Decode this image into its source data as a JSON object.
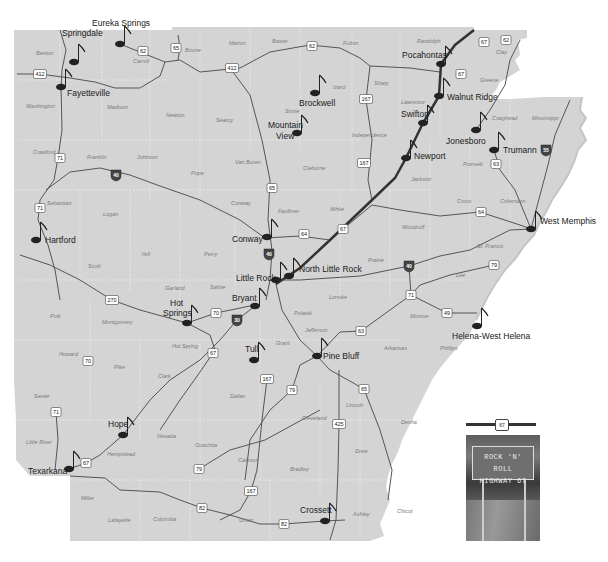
{
  "map": {
    "title": "Rock 'n' Roll Highway 67 - Arkansas",
    "colors": {
      "state_fill": "#d4d4d4",
      "background": "#ffffff",
      "county_border": "#eeeeee",
      "road": "#555555",
      "highway67": "#333333",
      "city_text": "#1a1a1a",
      "county_text": "#7a7a7a"
    },
    "cities": [
      {
        "name": "Eureka Springs",
        "x": 92,
        "y": 26,
        "dot_x": 120,
        "dot_y": 44
      },
      {
        "name": "Springdale",
        "x": 62,
        "y": 36,
        "dot_x": 74,
        "dot_y": 62
      },
      {
        "name": "Fayetteville",
        "x": 67,
        "y": 96,
        "dot_x": 61,
        "dot_y": 87
      },
      {
        "name": "Brockwell",
        "x": 299,
        "y": 106,
        "dot_x": 315,
        "dot_y": 93
      },
      {
        "name": "Mountain",
        "x": 268,
        "y": 128,
        "dot_x": 297,
        "dot_y": 133
      },
      {
        "name": "View",
        "x": 276,
        "y": 139,
        "dot_x": 0,
        "dot_y": 0
      },
      {
        "name": "Pocahontas",
        "x": 402,
        "y": 58,
        "dot_x": 441,
        "dot_y": 64
      },
      {
        "name": "Walnut Ridge",
        "x": 447,
        "y": 100,
        "dot_x": 439,
        "dot_y": 96
      },
      {
        "name": "Swifton",
        "x": 401,
        "y": 117,
        "dot_x": 423,
        "dot_y": 123
      },
      {
        "name": "Jonesboro",
        "x": 446,
        "y": 144,
        "dot_x": 476,
        "dot_y": 130
      },
      {
        "name": "Trumann",
        "x": 503,
        "y": 153,
        "dot_x": 494,
        "dot_y": 150
      },
      {
        "name": "Newport",
        "x": 414,
        "y": 159,
        "dot_x": 406,
        "dot_y": 158
      },
      {
        "name": "Hartford",
        "x": 45,
        "y": 243,
        "dot_x": 36,
        "dot_y": 240
      },
      {
        "name": "Conway",
        "x": 232,
        "y": 242,
        "dot_x": 267,
        "dot_y": 237
      },
      {
        "name": "West Memphis",
        "x": 540,
        "y": 224,
        "dot_x": 531,
        "dot_y": 229
      },
      {
        "name": "Little Rock",
        "x": 236,
        "y": 281,
        "dot_x": 276,
        "dot_y": 280
      },
      {
        "name": "North Little Rock",
        "x": 299,
        "y": 272,
        "dot_x": 289,
        "dot_y": 276
      },
      {
        "name": "Hot",
        "x": 170,
        "y": 306,
        "dot_x": 187,
        "dot_y": 323
      },
      {
        "name": "Springs",
        "x": 163,
        "y": 316,
        "dot_x": 0,
        "dot_y": 0
      },
      {
        "name": "Bryant",
        "x": 232,
        "y": 301,
        "dot_x": 255,
        "dot_y": 306
      },
      {
        "name": "Helena-West Helena",
        "x": 452,
        "y": 339,
        "dot_x": 477,
        "dot_y": 326
      },
      {
        "name": "Tull",
        "x": 245,
        "y": 352,
        "dot_x": 254,
        "dot_y": 360
      },
      {
        "name": "Pine Bluff",
        "x": 323,
        "y": 359,
        "dot_x": 317,
        "dot_y": 356
      },
      {
        "name": "Hope",
        "x": 108,
        "y": 427,
        "dot_x": 123,
        "dot_y": 435
      },
      {
        "name": "Texarkana",
        "x": 28,
        "y": 474,
        "dot_x": 69,
        "dot_y": 469
      },
      {
        "name": "Crossett",
        "x": 300,
        "y": 513,
        "dot_x": 325,
        "dot_y": 521
      }
    ],
    "counties": [
      {
        "name": "Benton",
        "x": 36,
        "y": 55
      },
      {
        "name": "Carroll",
        "x": 133,
        "y": 63
      },
      {
        "name": "Boone",
        "x": 185,
        "y": 52
      },
      {
        "name": "Marion",
        "x": 229,
        "y": 45
      },
      {
        "name": "Baxter",
        "x": 272,
        "y": 43
      },
      {
        "name": "Fulton",
        "x": 343,
        "y": 45
      },
      {
        "name": "Randolph",
        "x": 417,
        "y": 43
      },
      {
        "name": "Clay",
        "x": 496,
        "y": 54
      },
      {
        "name": "Washington",
        "x": 26,
        "y": 108
      },
      {
        "name": "Madison",
        "x": 107,
        "y": 109
      },
      {
        "name": "Newton",
        "x": 166,
        "y": 117
      },
      {
        "name": "Searcy",
        "x": 216,
        "y": 122
      },
      {
        "name": "Stone",
        "x": 285,
        "y": 113
      },
      {
        "name": "Izard",
        "x": 333,
        "y": 89
      },
      {
        "name": "Sharp",
        "x": 374,
        "y": 85
      },
      {
        "name": "Greene",
        "x": 480,
        "y": 82
      },
      {
        "name": "Lawrence",
        "x": 401,
        "y": 104
      },
      {
        "name": "Independence",
        "x": 352,
        "y": 137
      },
      {
        "name": "Craighead",
        "x": 492,
        "y": 120
      },
      {
        "name": "Mississippi",
        "x": 532,
        "y": 120
      },
      {
        "name": "Crawford",
        "x": 33,
        "y": 154
      },
      {
        "name": "Franklin",
        "x": 87,
        "y": 159
      },
      {
        "name": "Johnson",
        "x": 137,
        "y": 159
      },
      {
        "name": "Van Buren",
        "x": 235,
        "y": 164
      },
      {
        "name": "Cleburne",
        "x": 303,
        "y": 170
      },
      {
        "name": "Poinsett",
        "x": 463,
        "y": 166
      },
      {
        "name": "Jackson",
        "x": 411,
        "y": 181
      },
      {
        "name": "Pope",
        "x": 191,
        "y": 175
      },
      {
        "name": "Sebastian",
        "x": 47,
        "y": 205
      },
      {
        "name": "Conway",
        "x": 231,
        "y": 205
      },
      {
        "name": "Faulkner",
        "x": 278,
        "y": 213
      },
      {
        "name": "White",
        "x": 330,
        "y": 211
      },
      {
        "name": "Cross",
        "x": 457,
        "y": 203
      },
      {
        "name": "Crittenden",
        "x": 500,
        "y": 203
      },
      {
        "name": "Logan",
        "x": 103,
        "y": 216
      },
      {
        "name": "Woodruff",
        "x": 402,
        "y": 229
      },
      {
        "name": "Yell",
        "x": 141,
        "y": 256
      },
      {
        "name": "Perry",
        "x": 204,
        "y": 256
      },
      {
        "name": "Prairie",
        "x": 368,
        "y": 262
      },
      {
        "name": "St. Francis",
        "x": 477,
        "y": 248
      },
      {
        "name": "Scott",
        "x": 88,
        "y": 268
      },
      {
        "name": "Garland",
        "x": 165,
        "y": 290
      },
      {
        "name": "Saline",
        "x": 210,
        "y": 289
      },
      {
        "name": "Lonoke",
        "x": 329,
        "y": 299
      },
      {
        "name": "Lee",
        "x": 456,
        "y": 277
      },
      {
        "name": "Polk",
        "x": 50,
        "y": 318
      },
      {
        "name": "Montgomery",
        "x": 102,
        "y": 324
      },
      {
        "name": "Pulaski",
        "x": 294,
        "y": 315
      },
      {
        "name": "Monroe",
        "x": 410,
        "y": 318
      },
      {
        "name": "Jefferson",
        "x": 305,
        "y": 332
      },
      {
        "name": "Hot Spring",
        "x": 172,
        "y": 348
      },
      {
        "name": "Howard",
        "x": 59,
        "y": 356
      },
      {
        "name": "Grant",
        "x": 276,
        "y": 345
      },
      {
        "name": "Arkansas",
        "x": 384,
        "y": 350
      },
      {
        "name": "Phillips",
        "x": 440,
        "y": 350
      },
      {
        "name": "Pike",
        "x": 114,
        "y": 369
      },
      {
        "name": "Clark",
        "x": 158,
        "y": 378
      },
      {
        "name": "Dallas",
        "x": 230,
        "y": 398
      },
      {
        "name": "Sevier",
        "x": 34,
        "y": 398
      },
      {
        "name": "Lincoln",
        "x": 346,
        "y": 407
      },
      {
        "name": "Desha",
        "x": 401,
        "y": 424
      },
      {
        "name": "Cleveland",
        "x": 302,
        "y": 420
      },
      {
        "name": "Nevada",
        "x": 157,
        "y": 438
      },
      {
        "name": "Ouachita",
        "x": 195,
        "y": 447
      },
      {
        "name": "Little River",
        "x": 26,
        "y": 444
      },
      {
        "name": "Hempstead",
        "x": 107,
        "y": 456
      },
      {
        "name": "Calhoun",
        "x": 238,
        "y": 462
      },
      {
        "name": "Drew",
        "x": 355,
        "y": 453
      },
      {
        "name": "Bradley",
        "x": 290,
        "y": 471
      },
      {
        "name": "Miller",
        "x": 81,
        "y": 500
      },
      {
        "name": "Lafayette",
        "x": 108,
        "y": 522
      },
      {
        "name": "Columbia",
        "x": 153,
        "y": 521
      },
      {
        "name": "Union",
        "x": 239,
        "y": 522
      },
      {
        "name": "Ashley",
        "x": 353,
        "y": 516
      },
      {
        "name": "Chicot",
        "x": 397,
        "y": 513
      }
    ],
    "us_shields": [
      {
        "num": "62",
        "x": 143,
        "y": 51
      },
      {
        "num": "65",
        "x": 176,
        "y": 48
      },
      {
        "num": "412",
        "x": 40,
        "y": 74
      },
      {
        "num": "412",
        "x": 232,
        "y": 68
      },
      {
        "num": "62",
        "x": 312,
        "y": 46
      },
      {
        "num": "67",
        "x": 484,
        "y": 42
      },
      {
        "name_hint": "",
        "num": "62",
        "x": 506,
        "y": 40
      },
      {
        "num": "67",
        "x": 461,
        "y": 74
      },
      {
        "num": "167",
        "x": 366,
        "y": 99
      },
      {
        "num": "71",
        "x": 60,
        "y": 158
      },
      {
        "num": "167",
        "x": 364,
        "y": 163
      },
      {
        "num": "65",
        "x": 272,
        "y": 188
      },
      {
        "num": "63",
        "x": 496,
        "y": 164
      },
      {
        "num": "71",
        "x": 40,
        "y": 208
      },
      {
        "num": "64",
        "x": 304,
        "y": 234
      },
      {
        "num": "67",
        "x": 343,
        "y": 229
      },
      {
        "num": "64",
        "x": 481,
        "y": 212
      },
      {
        "name_hint": "",
        "num": "270",
        "x": 112,
        "y": 300
      },
      {
        "num": "79",
        "x": 494,
        "y": 265
      },
      {
        "num": "70",
        "x": 216,
        "y": 313
      },
      {
        "num": "71",
        "x": 411,
        "y": 295
      },
      {
        "num": "49",
        "x": 447,
        "y": 313
      },
      {
        "num": "63",
        "x": 361,
        "y": 331
      },
      {
        "num": "70",
        "x": 88,
        "y": 361
      },
      {
        "num": "67",
        "x": 213,
        "y": 353
      },
      {
        "num": "167",
        "x": 267,
        "y": 379
      },
      {
        "num": "79",
        "x": 292,
        "y": 390
      },
      {
        "num": "65",
        "x": 364,
        "y": 389
      },
      {
        "name_hint": "",
        "num": "71",
        "x": 56,
        "y": 412
      },
      {
        "num": "425",
        "x": 339,
        "y": 424
      },
      {
        "num": "67",
        "x": 86,
        "y": 463
      },
      {
        "num": "79",
        "x": 199,
        "y": 469
      },
      {
        "num": "167",
        "x": 251,
        "y": 491
      },
      {
        "num": "82",
        "x": 202,
        "y": 508
      },
      {
        "num": "82",
        "x": 284,
        "y": 524
      }
    ],
    "interstate_shields": [
      {
        "num": "40",
        "x": 116,
        "y": 175
      },
      {
        "num": "40",
        "x": 269,
        "y": 254
      },
      {
        "num": "55",
        "x": 546,
        "y": 150
      },
      {
        "num": "40",
        "x": 409,
        "y": 266
      },
      {
        "num": "30",
        "x": 237,
        "y": 320
      }
    ],
    "inset": {
      "shield_num": "67",
      "sign_line1": "ROCK 'N' ROLL",
      "sign_line2": "HIGHWAY 67"
    }
  }
}
